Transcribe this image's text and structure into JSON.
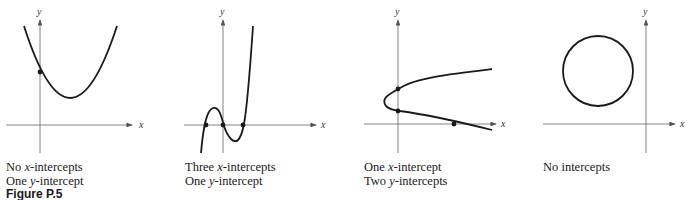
{
  "figure_label": "Figure P.5",
  "axis_labels": {
    "x": "x",
    "y": "y"
  },
  "panels": [
    {
      "id": "parabola-up",
      "shape": "upward parabola",
      "caption_line1_prefix": "No ",
      "caption_line1_var": "x",
      "caption_line1_suffix": "-intercepts",
      "caption_line2_prefix": "One ",
      "caption_line2_var": "y",
      "caption_line2_suffix": "-intercept",
      "x_intercepts": 0,
      "y_intercepts": 1
    },
    {
      "id": "cubic",
      "shape": "cubic curve",
      "caption_line1_prefix": "Three ",
      "caption_line1_var": "x",
      "caption_line1_suffix": "-intercepts",
      "caption_line2_prefix": "One ",
      "caption_line2_var": "y",
      "caption_line2_suffix": "-intercept",
      "x_intercepts": 3,
      "y_intercepts": 1
    },
    {
      "id": "sideways-parabola",
      "shape": "sideways parabola opening right",
      "caption_line1_prefix": "One ",
      "caption_line1_var": "x",
      "caption_line1_suffix": "-intercept",
      "caption_line2_prefix": "Two ",
      "caption_line2_var": "y",
      "caption_line2_suffix": "-intercepts",
      "x_intercepts": 1,
      "y_intercepts": 2
    },
    {
      "id": "circle",
      "shape": "circle in second quadrant",
      "caption_line1_prefix": "No intercepts",
      "caption_line1_var": "",
      "caption_line1_suffix": "",
      "x_intercepts": 0,
      "y_intercepts": 0
    }
  ]
}
